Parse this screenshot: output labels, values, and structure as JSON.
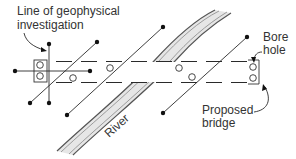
{
  "diagram": {
    "type": "site-plan",
    "labels": {
      "line_of_geophysical_1": "Line of geophysical",
      "line_of_geophysical_2": "investigation",
      "bore_hole_1": "Bore",
      "bore_hole_2": "hole",
      "proposed_bridge_1": "Proposed",
      "proposed_bridge_2": "bridge",
      "river": "River"
    },
    "colors": {
      "line": "#2a2a2a",
      "river_fill": "#e6e6e6",
      "background": "#ffffff"
    },
    "elements": {
      "road_alignment": "dashed parallel lines (proposed bridge centreline corridor)",
      "geophysical_lines": 5,
      "bore_holes": 8,
      "bridge_abutment_boxes": 2
    }
  }
}
